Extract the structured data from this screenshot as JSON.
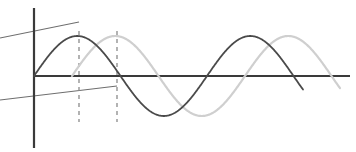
{
  "figure": {
    "width": 356,
    "height": 152,
    "background_color": "#ffffff"
  },
  "colors": {
    "axis": "#3a3a3a",
    "wave_primary": "#4a4a4a",
    "wave_secondary": "#cfcfcf",
    "dashed_marker": "#8a8a8a",
    "slanted_line": "#6e6e6e"
  },
  "axes": {
    "origin": {
      "x": 34,
      "y": 76
    },
    "vertical_axis": {
      "x": 34,
      "y_top": 8,
      "y_bottom": 148,
      "stroke_width": 2.2
    },
    "horizontal_axis": {
      "y": 76,
      "x_left": 34,
      "x_right": 350,
      "stroke_width": 2.2
    }
  },
  "markers": {
    "dashed_verticals": [
      {
        "name": "peak-marker-primary",
        "x": 79,
        "y_top": 31,
        "y_bottom": 122
      },
      {
        "name": "peak-marker-secondary",
        "x": 117,
        "y_top": 31,
        "y_bottom": 122
      }
    ],
    "slanted_lines": [
      {
        "name": "upper-slanted-line",
        "x1": 0,
        "y1": 38,
        "x2": 79,
        "y2": 22
      },
      {
        "name": "lower-slanted-line",
        "x1": 0,
        "y1": 100,
        "x2": 117,
        "y2": 86
      }
    ]
  },
  "chart_data": {
    "type": "line",
    "xlabel": "",
    "ylabel": "",
    "grid": false,
    "legend": "none",
    "xlim": [
      34,
      350
    ],
    "ylim": [
      -1.05,
      1.05
    ],
    "baseline_y": 76,
    "amplitude_px": 40,
    "wavelength_px": 173,
    "series": [
      {
        "name": "primary-wave",
        "color": "#4a4a4a",
        "stroke_width": 1.8,
        "phase_shift_px": 0,
        "x_start": 34,
        "x_end": 303,
        "peaks": [
          {
            "x": 79,
            "y": 36
          },
          {
            "x": 252,
            "y": 36
          }
        ],
        "troughs": [
          {
            "x": 165,
            "y": 116
          }
        ],
        "zero_crossings": [
          34,
          121,
          208,
          295
        ]
      },
      {
        "name": "secondary-wave",
        "color": "#cfcfcf",
        "stroke_width": 2.2,
        "phase_shift_px": 38,
        "x_start": 72,
        "x_end": 340,
        "peaks": [
          {
            "x": 117,
            "y": 36
          },
          {
            "x": 290,
            "y": 36
          }
        ],
        "troughs": [
          {
            "x": 203,
            "y": 116
          }
        ],
        "zero_crossings": [
          72,
          159,
          246,
          333
        ]
      }
    ]
  }
}
